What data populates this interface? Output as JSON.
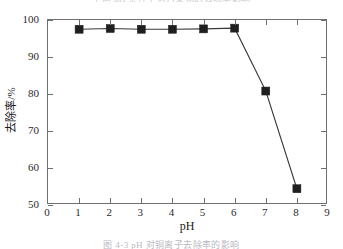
{
  "figure": {
    "caption_top": "不同 pH 条件下对污染物的去除率影响",
    "caption_bottom": "图 4-3   pH 对铜离子去除率的影响"
  },
  "chart_data": {
    "type": "line",
    "title": "",
    "xlabel": "pH",
    "ylabel": "去除率/%",
    "xlim": [
      0,
      9
    ],
    "ylim": [
      50,
      100
    ],
    "xticks": [
      "0",
      "1",
      "2",
      "3",
      "4",
      "5",
      "6",
      "7",
      "8",
      "9"
    ],
    "yticks": [
      "50",
      "60",
      "70",
      "80",
      "90",
      "100"
    ],
    "xtick_values": [
      0,
      1,
      2,
      3,
      4,
      5,
      6,
      7,
      8,
      9
    ],
    "ytick_values": [
      50,
      60,
      70,
      80,
      90,
      100
    ],
    "grid": false,
    "legend": null,
    "marker": "filled-square",
    "marker_color": "#1f1f1f",
    "line_color": "#3a3a3a",
    "x": [
      1,
      2,
      3,
      4,
      5,
      6,
      7,
      8
    ],
    "values": [
      97.5,
      97.7,
      97.5,
      97.5,
      97.6,
      97.8,
      80.8,
      54.4
    ],
    "series": [
      {
        "name": "去除率",
        "x": [
          1,
          2,
          3,
          4,
          5,
          6,
          7,
          8
        ],
        "values": [
          97.5,
          97.7,
          97.5,
          97.5,
          97.6,
          97.8,
          80.8,
          54.4
        ]
      }
    ]
  }
}
